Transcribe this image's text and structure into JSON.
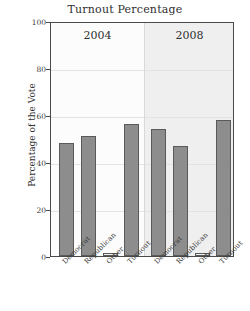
{
  "chart_data": {
    "type": "bar",
    "title": "Turnout Percentage",
    "xlabel": "",
    "ylabel": "Percentage of the Vote",
    "ylim": [
      0,
      100
    ],
    "yticks": [
      0,
      20,
      40,
      60,
      80,
      100
    ],
    "grid": true,
    "legend": "none",
    "panels": [
      {
        "label": "2004",
        "categories": [
          "Democrat",
          "Republican",
          "Other",
          "Turnout"
        ],
        "values": [
          48,
          51,
          1,
          56
        ]
      },
      {
        "label": "2008",
        "categories": [
          "Democrat",
          "Republican",
          "Other",
          "Turnout"
        ],
        "values": [
          54,
          47,
          1,
          58
        ]
      }
    ]
  },
  "axis": {
    "y_label": "Percentage of the Vote",
    "tick_0": "0",
    "tick_20": "20",
    "tick_40": "40",
    "tick_60": "60",
    "tick_80": "80",
    "tick_100": "100"
  },
  "colors": {
    "bar_fill": "#8d8d8d",
    "bar_stroke": "#5a5a5a",
    "panel_left_bg": "#fcfcfc",
    "panel_right_bg": "#efefef",
    "frame": "#4a4a4a",
    "grid": "#e3e3e3"
  }
}
